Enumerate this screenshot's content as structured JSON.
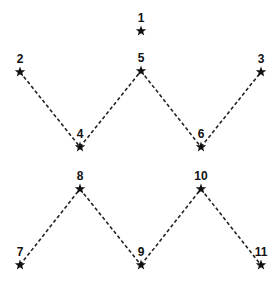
{
  "diagram": {
    "type": "connect-the-dots",
    "nodes": [
      {
        "id": "1",
        "label": "1",
        "x": 141,
        "y": 31
      },
      {
        "id": "2",
        "label": "2",
        "x": 20,
        "y": 72
      },
      {
        "id": "3",
        "label": "3",
        "x": 261,
        "y": 72
      },
      {
        "id": "4",
        "label": "4",
        "x": 80,
        "y": 147
      },
      {
        "id": "5",
        "label": "5",
        "x": 141,
        "y": 71
      },
      {
        "id": "6",
        "label": "6",
        "x": 201,
        "y": 147
      },
      {
        "id": "7",
        "label": "7",
        "x": 20,
        "y": 265
      },
      {
        "id": "8",
        "label": "8",
        "x": 80,
        "y": 189
      },
      {
        "id": "9",
        "label": "9",
        "x": 141,
        "y": 265
      },
      {
        "id": "10",
        "label": "10",
        "x": 201,
        "y": 189
      },
      {
        "id": "11",
        "label": "11",
        "x": 261,
        "y": 265
      }
    ],
    "edges": [
      [
        "2",
        "4"
      ],
      [
        "4",
        "5"
      ],
      [
        "5",
        "6"
      ],
      [
        "6",
        "3"
      ],
      [
        "7",
        "8"
      ],
      [
        "8",
        "9"
      ],
      [
        "9",
        "10"
      ],
      [
        "10",
        "11"
      ]
    ],
    "marker": "star-icon",
    "line_style": "dashed"
  }
}
